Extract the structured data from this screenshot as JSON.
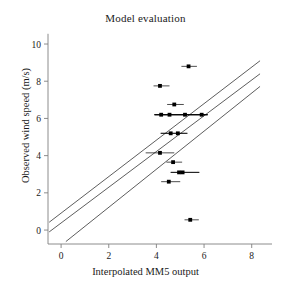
{
  "chart_data": {
    "type": "scatter",
    "title": "Model evaluation",
    "xlabel": "Interpolated MM5 output",
    "ylabel": "Observed wind speed (m/s)",
    "xlim": [
      -0.55,
      8.6
    ],
    "ylim": [
      -0.75,
      10.7
    ],
    "xticks": [
      0,
      2,
      4,
      6,
      8
    ],
    "yticks": [
      0,
      2,
      4,
      6,
      8,
      10
    ],
    "xtick_labels": [
      "0",
      "2",
      "4",
      "6",
      "8"
    ],
    "ytick_labels": [
      "0",
      "2",
      "4",
      "6",
      "8",
      "10"
    ],
    "grid": false,
    "legend": "none",
    "marker": "square",
    "marker_color": "#000000",
    "errorbar_orientation": "horizontal",
    "line_color": "#333333",
    "axis_color": "#808080",
    "points": [
      {
        "x": 5.35,
        "y": 8.8,
        "xerr_low": 5.05,
        "xerr_high": 5.7
      },
      {
        "x": 4.15,
        "y": 7.75,
        "xerr_low": 3.88,
        "xerr_high": 4.55
      },
      {
        "x": 4.75,
        "y": 6.75,
        "xerr_low": 4.45,
        "xerr_high": 5.15
      },
      {
        "x": 4.2,
        "y": 6.2,
        "xerr_low": 3.92,
        "xerr_high": 6.15
      },
      {
        "x": 4.55,
        "y": 6.2,
        "xerr_low": 3.92,
        "xerr_high": 6.15
      },
      {
        "x": 5.2,
        "y": 6.2,
        "xerr_low": 3.92,
        "xerr_high": 6.15
      },
      {
        "x": 5.9,
        "y": 6.2,
        "xerr_low": 3.92,
        "xerr_high": 6.15
      },
      {
        "x": 4.6,
        "y": 5.2,
        "xerr_low": 4.18,
        "xerr_high": 5.3
      },
      {
        "x": 4.9,
        "y": 5.2,
        "xerr_low": 4.18,
        "xerr_high": 5.3
      },
      {
        "x": 4.15,
        "y": 4.15,
        "xerr_low": 3.55,
        "xerr_high": 4.75
      },
      {
        "x": 4.7,
        "y": 3.65,
        "xerr_low": 4.42,
        "xerr_high": 5.08
      },
      {
        "x": 4.95,
        "y": 3.1,
        "xerr_low": 4.6,
        "xerr_high": 5.8
      },
      {
        "x": 5.1,
        "y": 3.1,
        "xerr_low": 4.6,
        "xerr_high": 5.8
      },
      {
        "x": 4.52,
        "y": 2.6,
        "xerr_low": 4.2,
        "xerr_high": 5.0
      },
      {
        "x": 5.42,
        "y": 0.55,
        "xerr_low": 5.18,
        "xerr_high": 5.78
      }
    ],
    "reference_lines": [
      {
        "name": "upper-bound-line",
        "x0": -0.5,
        "y0": 0.42,
        "x1": 8.35,
        "y1": 9.1
      },
      {
        "name": "identity-line",
        "x0": -0.5,
        "y0": -0.1,
        "x1": 8.35,
        "y1": 8.4
      },
      {
        "name": "lower-bound-line",
        "x0": 0.2,
        "y0": -0.62,
        "x1": 8.35,
        "y1": 7.72
      }
    ]
  }
}
